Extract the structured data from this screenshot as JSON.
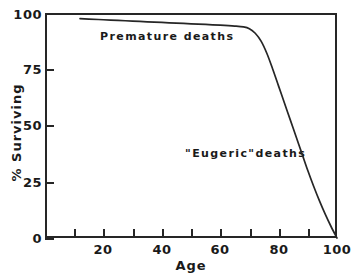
{
  "chart_data": {
    "type": "line",
    "title": "",
    "subtitle": "",
    "xlabel": "Age",
    "ylabel": "% Surviving",
    "xlim": [
      0,
      100
    ],
    "ylim": [
      0,
      100
    ],
    "grid": false,
    "legend": "none",
    "x_ticks": [
      0,
      10,
      20,
      30,
      40,
      50,
      60,
      70,
      80,
      90,
      100
    ],
    "x_tick_labels": [
      "",
      "",
      "20",
      "",
      "40",
      "",
      "60",
      "",
      "80",
      "",
      "100"
    ],
    "y_ticks": [
      0,
      25,
      50,
      75,
      100
    ],
    "y_tick_labels": [
      "0",
      "25",
      "50",
      "75",
      "100"
    ],
    "tick_direction": "in",
    "line_color": "#262626",
    "axis_color": "#262626",
    "background_color": "#ffffff",
    "series": [
      {
        "name": "survival curve",
        "x": [
          12,
          15,
          20,
          25,
          30,
          35,
          40,
          45,
          50,
          55,
          60,
          65,
          68,
          70,
          72,
          74,
          76,
          78,
          80,
          82,
          84,
          86,
          88,
          90,
          92,
          94,
          96,
          98,
          100
        ],
        "y": [
          97.5,
          97.3,
          97.0,
          96.7,
          96.4,
          96.1,
          95.8,
          95.5,
          95.2,
          94.9,
          94.6,
          94.2,
          93.8,
          93.0,
          91.0,
          87.5,
          82.0,
          75.0,
          67.5,
          60.0,
          52.5,
          45.0,
          37.5,
          30.0,
          23.0,
          16.5,
          10.5,
          5.0,
          0.0
        ]
      }
    ],
    "annotations": [
      {
        "text": "Premature deaths",
        "x": 30,
        "y": 93
      },
      {
        "text": "\"Eugeric\"deaths",
        "x": 60,
        "y": 40
      }
    ]
  },
  "axes": {
    "y_tick_labels": [
      "100",
      "75",
      "50",
      "25",
      "0"
    ],
    "x_tick_labels": [
      "20",
      "40",
      "60",
      "80",
      "100"
    ],
    "x_title": "Age",
    "y_title": "% Surviving"
  },
  "annotations": {
    "premature": "Premature deaths",
    "eugeric": "\"Eugeric\"deaths"
  }
}
